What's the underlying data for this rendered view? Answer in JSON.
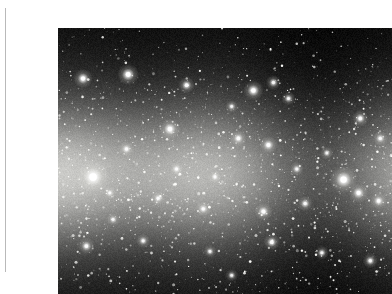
{
  "page": {
    "background_color": "#ffffff",
    "width": 366,
    "height": 292,
    "margin_rule_color": "#b9b9b9"
  },
  "figure": {
    "name": "milky-way-photograph",
    "caption": "",
    "x": 18,
    "y": 12,
    "width": 334,
    "height": 266,
    "border_color": "#000000",
    "background_color": "#000000"
  },
  "image_content": {
    "subject": "Milky Way galactic band",
    "description": "Dense star field with a luminous horizontal galactic plane across the middle, crossed by dark dust lanes, on a black sky background",
    "color_mode": "grayscale",
    "sky_color": "#000000",
    "band_color": "#c8c8c4",
    "star_color": "#ffffff",
    "dust_lane_color": "#1c1c1c",
    "band_center_y_fraction": 0.55,
    "band_half_height_fraction": 0.3,
    "star_count": 2400,
    "bright_stars": [
      {
        "x": 0.105,
        "y": 0.56,
        "r": 5.2,
        "mag": 1.0
      },
      {
        "x": 0.075,
        "y": 0.19,
        "r": 3.0,
        "mag": 0.95
      },
      {
        "x": 0.21,
        "y": 0.175,
        "r": 3.4,
        "mag": 0.95
      },
      {
        "x": 0.385,
        "y": 0.215,
        "r": 2.6,
        "mag": 0.85
      },
      {
        "x": 0.585,
        "y": 0.235,
        "r": 3.2,
        "mag": 0.95
      },
      {
        "x": 0.645,
        "y": 0.205,
        "r": 2.4,
        "mag": 0.8
      },
      {
        "x": 0.69,
        "y": 0.265,
        "r": 2.2,
        "mag": 0.8
      },
      {
        "x": 0.52,
        "y": 0.295,
        "r": 2.0,
        "mag": 0.75
      },
      {
        "x": 0.335,
        "y": 0.38,
        "r": 3.2,
        "mag": 0.95
      },
      {
        "x": 0.54,
        "y": 0.415,
        "r": 2.6,
        "mag": 0.85
      },
      {
        "x": 0.63,
        "y": 0.44,
        "r": 2.8,
        "mag": 0.9
      },
      {
        "x": 0.205,
        "y": 0.455,
        "r": 2.4,
        "mag": 0.82
      },
      {
        "x": 0.905,
        "y": 0.34,
        "r": 2.6,
        "mag": 0.85
      },
      {
        "x": 0.965,
        "y": 0.415,
        "r": 2.4,
        "mag": 0.8
      },
      {
        "x": 0.855,
        "y": 0.57,
        "r": 4.4,
        "mag": 1.0
      },
      {
        "x": 0.9,
        "y": 0.62,
        "r": 3.0,
        "mag": 0.92
      },
      {
        "x": 0.96,
        "y": 0.65,
        "r": 2.6,
        "mag": 0.86
      },
      {
        "x": 0.3,
        "y": 0.64,
        "r": 2.2,
        "mag": 0.8
      },
      {
        "x": 0.435,
        "y": 0.68,
        "r": 2.4,
        "mag": 0.82
      },
      {
        "x": 0.615,
        "y": 0.69,
        "r": 2.8,
        "mag": 0.88
      },
      {
        "x": 0.74,
        "y": 0.66,
        "r": 2.4,
        "mag": 0.82
      },
      {
        "x": 0.165,
        "y": 0.72,
        "r": 2.0,
        "mag": 0.78
      },
      {
        "x": 0.085,
        "y": 0.82,
        "r": 2.6,
        "mag": 0.85
      },
      {
        "x": 0.255,
        "y": 0.8,
        "r": 2.2,
        "mag": 0.8
      },
      {
        "x": 0.455,
        "y": 0.84,
        "r": 2.0,
        "mag": 0.78
      },
      {
        "x": 0.64,
        "y": 0.805,
        "r": 2.6,
        "mag": 0.86
      },
      {
        "x": 0.79,
        "y": 0.845,
        "r": 2.2,
        "mag": 0.8
      },
      {
        "x": 0.935,
        "y": 0.875,
        "r": 2.4,
        "mag": 0.82
      },
      {
        "x": 0.52,
        "y": 0.93,
        "r": 2.0,
        "mag": 0.76
      },
      {
        "x": 0.355,
        "y": 0.53,
        "r": 2.2,
        "mag": 0.8
      },
      {
        "x": 0.47,
        "y": 0.56,
        "r": 2.0,
        "mag": 0.78
      },
      {
        "x": 0.155,
        "y": 0.62,
        "r": 2.0,
        "mag": 0.76
      },
      {
        "x": 0.715,
        "y": 0.53,
        "r": 2.2,
        "mag": 0.8
      },
      {
        "x": 0.805,
        "y": 0.47,
        "r": 2.0,
        "mag": 0.76
      }
    ],
    "dust_lanes": [
      {
        "x": 0.32,
        "y": 0.53,
        "rx": 0.085,
        "ry": 0.07,
        "opacity": 0.8
      },
      {
        "x": 0.25,
        "y": 0.56,
        "rx": 0.055,
        "ry": 0.05,
        "opacity": 0.6
      },
      {
        "x": 0.545,
        "y": 0.6,
        "rx": 0.075,
        "ry": 0.04,
        "opacity": 0.55
      },
      {
        "x": 0.66,
        "y": 0.59,
        "rx": 0.05,
        "ry": 0.03,
        "opacity": 0.4
      },
      {
        "x": 0.76,
        "y": 0.43,
        "rx": 0.06,
        "ry": 0.045,
        "opacity": 0.45
      },
      {
        "x": 0.115,
        "y": 0.48,
        "rx": 0.045,
        "ry": 0.06,
        "opacity": 0.4
      },
      {
        "x": 0.43,
        "y": 0.66,
        "rx": 0.065,
        "ry": 0.035,
        "opacity": 0.35
      },
      {
        "x": 0.88,
        "y": 0.5,
        "rx": 0.055,
        "ry": 0.05,
        "opacity": 0.35
      }
    ],
    "bright_clouds": [
      {
        "x": 0.11,
        "y": 0.57,
        "rx": 0.09,
        "ry": 0.09,
        "opacity": 0.55
      },
      {
        "x": 0.47,
        "y": 0.52,
        "rx": 0.12,
        "ry": 0.08,
        "opacity": 0.4
      },
      {
        "x": 0.69,
        "y": 0.545,
        "rx": 0.11,
        "ry": 0.085,
        "opacity": 0.42
      },
      {
        "x": 0.86,
        "y": 0.58,
        "rx": 0.09,
        "ry": 0.07,
        "opacity": 0.45
      },
      {
        "x": 0.3,
        "y": 0.43,
        "rx": 0.1,
        "ry": 0.06,
        "opacity": 0.3
      }
    ]
  }
}
